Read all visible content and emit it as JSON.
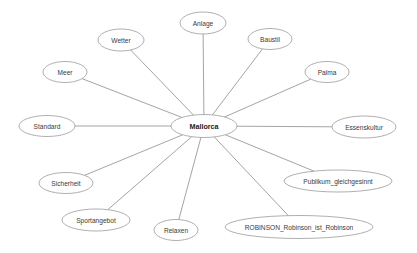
{
  "diagram": {
    "type": "radial-mind-map",
    "canvas": {
      "width": 417,
      "height": 253,
      "background": "#ffffff"
    },
    "style": {
      "node_outline_color": "#9a9a9a",
      "node_fill_color": "#ffffff",
      "edge_color": "#8d8d8d",
      "label_color": "#3a3a3a",
      "center_label_color": "#222222"
    },
    "center_node": {
      "id": "mallorca",
      "label": "Mallorca",
      "bold": true,
      "cx": 204,
      "cy": 126,
      "rx": 33,
      "ry": 11.5
    },
    "nodes": [
      {
        "id": "anlage",
        "label": "Anlage",
        "cx": 203,
        "cy": 23,
        "rx": 23,
        "ry": 11
      },
      {
        "id": "baustil",
        "label": "Baustil",
        "cx": 270,
        "cy": 39,
        "rx": 22,
        "ry": 10.5
      },
      {
        "id": "palma",
        "label": "Palma",
        "cx": 327,
        "cy": 72,
        "rx": 22,
        "ry": 10.5
      },
      {
        "id": "essenskultur",
        "label": "Essenskultur",
        "cx": 364,
        "cy": 127,
        "rx": 32,
        "ry": 11
      },
      {
        "id": "publikum_gleichgesinnt",
        "label": "Publikum_gleichgesinnt",
        "cx": 338,
        "cy": 181,
        "rx": 54,
        "ry": 11
      },
      {
        "id": "robinson",
        "label": "ROBINSON_Robinson_ist_Robinson",
        "cx": 299,
        "cy": 227,
        "rx": 74,
        "ry": 11.5
      },
      {
        "id": "relaxen",
        "label": "Relaxen",
        "cx": 176,
        "cy": 230,
        "rx": 22,
        "ry": 10.5
      },
      {
        "id": "sportangebot",
        "label": "Sportangebot",
        "cx": 96,
        "cy": 220,
        "rx": 34,
        "ry": 11
      },
      {
        "id": "sicherheit",
        "label": "Sicherheit",
        "cx": 66,
        "cy": 183,
        "rx": 27,
        "ry": 10.5
      },
      {
        "id": "standard",
        "label": "Standard",
        "cx": 47,
        "cy": 126,
        "rx": 28,
        "ry": 10.5
      },
      {
        "id": "meer",
        "label": "Meer",
        "cx": 65,
        "cy": 72,
        "rx": 22,
        "ry": 10.5
      },
      {
        "id": "wetter",
        "label": "Wetter",
        "cx": 121,
        "cy": 40,
        "rx": 23,
        "ry": 11
      }
    ],
    "edges": [
      {
        "from": "mallorca",
        "to": "anlage"
      },
      {
        "from": "mallorca",
        "to": "baustil"
      },
      {
        "from": "mallorca",
        "to": "palma"
      },
      {
        "from": "mallorca",
        "to": "essenskultur"
      },
      {
        "from": "mallorca",
        "to": "publikum_gleichgesinnt"
      },
      {
        "from": "mallorca",
        "to": "robinson"
      },
      {
        "from": "mallorca",
        "to": "relaxen"
      },
      {
        "from": "mallorca",
        "to": "sportangebot"
      },
      {
        "from": "mallorca",
        "to": "sicherheit"
      },
      {
        "from": "mallorca",
        "to": "standard"
      },
      {
        "from": "mallorca",
        "to": "meer"
      },
      {
        "from": "mallorca",
        "to": "wetter"
      }
    ]
  }
}
